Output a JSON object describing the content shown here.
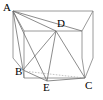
{
  "figure": {
    "kind": "geometry-diagram",
    "width": 103,
    "height": 100,
    "stroke_color": "#7a7a7a",
    "stroke_dark_color": "#4d4d4d",
    "dashed_color": "#9a9a9a",
    "background_color": "#ffffff",
    "label_color": "#000000"
  },
  "labels": [
    {
      "text": "A",
      "x": 3,
      "y": 2
    },
    {
      "text": "D",
      "x": 57,
      "y": 18
    },
    {
      "text": "B",
      "x": 15,
      "y": 66
    },
    {
      "text": "E",
      "x": 43,
      "y": 82
    },
    {
      "text": "C",
      "x": 85,
      "y": 80
    }
  ],
  "points": {
    "A": {
      "x": 13,
      "y": 11
    },
    "D": {
      "x": 56,
      "y": 31
    },
    "B": {
      "x": 23,
      "y": 70
    },
    "E": {
      "x": 47,
      "y": 81
    },
    "C": {
      "x": 85,
      "y": 78
    },
    "top_back_right": {
      "x": 93,
      "y": 11
    },
    "top_front_left": {
      "x": 24,
      "y": 31
    },
    "top_back_left_hidden": {
      "x": 82,
      "y": 31
    },
    "bottom_front_left": {
      "x": 24,
      "y": 78
    },
    "bottom_left_low": {
      "x": 13,
      "y": 58
    },
    "bottom_back_right": {
      "x": 93,
      "y": 58
    }
  },
  "segments": [
    {
      "name": "edge-A-to-top-back-right",
      "from": "A",
      "to": "top_back_right",
      "style": "solid"
    },
    {
      "name": "edge-A-to-top-front-left",
      "from": "A",
      "to": "top_front_left",
      "style": "solid"
    },
    {
      "name": "edge-A-to-bottom-left-low",
      "from": "A",
      "to": "bottom_left_low",
      "style": "solid"
    },
    {
      "name": "edge-top-front-left-to-D",
      "from": "top_front_left",
      "to": "D",
      "style": "solid"
    },
    {
      "name": "edge-D-to-top-back-left-hidden",
      "from": "D",
      "to": "top_back_left_hidden",
      "style": "solid"
    },
    {
      "name": "edge-top-back-right-to-back-right-bottom",
      "from": "top_back_right",
      "to": "bottom_back_right",
      "style": "solid"
    },
    {
      "name": "edge-top-back-left-hidden-to-top-back-right",
      "from": "top_back_left_hidden",
      "to": "top_back_right",
      "style": "solid"
    },
    {
      "name": "edge-D-to-C",
      "from": "D",
      "to": "C",
      "style": "solid"
    },
    {
      "name": "edge-bottom-front-left-to-C",
      "from": "bottom_front_left",
      "to": "C",
      "style": "solid"
    },
    {
      "name": "edge-D-vertical-to-bottom-front",
      "from": "D",
      "to": "E",
      "style": "solid"
    },
    {
      "name": "edge-top-front-left-to-bottom-front-left",
      "from": "top_front_left",
      "to": "bottom_front_left",
      "style": "solid"
    },
    {
      "name": "edge-bottom-left-low-to-B",
      "from": "bottom_left_low",
      "to": "B",
      "style": "solid"
    },
    {
      "name": "edge-B-to-bottom-front-left",
      "from": "B",
      "to": "bottom_front_left",
      "style": "solid"
    },
    {
      "name": "diagonal-A-to-D",
      "from": "A",
      "to": "D",
      "style": "solid"
    },
    {
      "name": "diagonal-A-to-B",
      "from": "A",
      "to": "B",
      "style": "solid"
    },
    {
      "name": "diagonal-A-to-E",
      "from": "A",
      "to": "E",
      "style": "solid"
    },
    {
      "name": "diagonal-B-to-E",
      "from": "B",
      "to": "E",
      "style": "solid"
    },
    {
      "name": "diagonal-B-to-C-dashed",
      "from": "B",
      "to": "C",
      "style": "dashed"
    },
    {
      "name": "diagonal-E-to-C",
      "from": "E",
      "to": "C",
      "style": "solid"
    },
    {
      "name": "diagonal-C-to-bottom-back-right",
      "from": "C",
      "to": "bottom_back_right",
      "style": "solid"
    }
  ]
}
